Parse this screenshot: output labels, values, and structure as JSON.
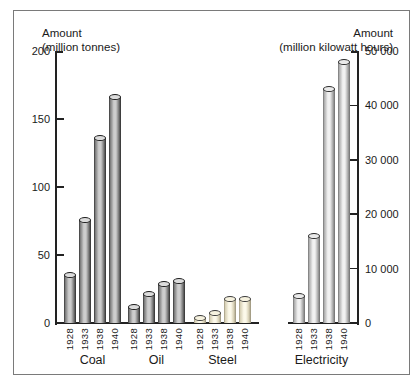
{
  "chart_data": {
    "type": "bar",
    "bar_shape": "cylinder",
    "grid": false,
    "legend": "none",
    "categories": [
      "1928",
      "1933",
      "1938",
      "1940"
    ],
    "groups": [
      {
        "label": "Coal",
        "axis": "left",
        "style": "dark_gray",
        "values": [
          35,
          76,
          136,
          166
        ]
      },
      {
        "label": "Oil",
        "axis": "left",
        "style": "dark_gray",
        "values": [
          12,
          21,
          29,
          31
        ]
      },
      {
        "label": "Steel",
        "axis": "left",
        "style": "cream",
        "values": [
          4,
          7,
          18,
          18
        ]
      },
      {
        "label": "Electricity",
        "axis": "right",
        "style": "light_gray",
        "values": [
          5000,
          16000,
          43000,
          48000
        ]
      }
    ],
    "left_axis": {
      "title": [
        "Amount",
        "(million tonnes)"
      ],
      "range": [
        0,
        200
      ],
      "ticks": [
        {
          "value": 0,
          "label": "0"
        },
        {
          "value": 50,
          "label": "50"
        },
        {
          "value": 100,
          "label": "100"
        },
        {
          "value": 150,
          "label": "150"
        },
        {
          "value": 200,
          "label": "200"
        }
      ]
    },
    "right_axis": {
      "title": [
        "Amount",
        "(million kilowatt hours)"
      ],
      "range": [
        0,
        50000
      ],
      "ticks": [
        {
          "value": 0,
          "label": "0"
        },
        {
          "value": 10000,
          "label": "10 000"
        },
        {
          "value": 20000,
          "label": "20 000"
        },
        {
          "value": 30000,
          "label": "30 000"
        },
        {
          "value": 40000,
          "label": "40 000"
        },
        {
          "value": 50000,
          "label": "50 000"
        }
      ]
    },
    "styles": {
      "dark_gray": {
        "edge": "#2d2d2d",
        "shade": "#787878",
        "light": "#cdcdcd",
        "cap": "#dcdcdc",
        "outline": "#1c1c1c"
      },
      "cream": {
        "edge": "#968f78",
        "shade": "#d6cfb4",
        "light": "#fcf9ea",
        "cap": "#f6f2df",
        "outline": "#3a3a3a"
      },
      "light_gray": {
        "edge": "#6d6d6d",
        "shade": "#aaaaaa",
        "light": "#f1f1f1",
        "cap": "#eaeaea",
        "outline": "#2a2a2a"
      }
    },
    "frame_color": "#7a7a7a",
    "axis_color": "#222222",
    "background": "#ffffff"
  }
}
